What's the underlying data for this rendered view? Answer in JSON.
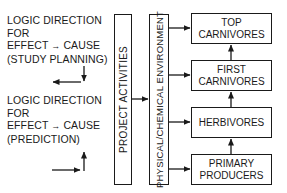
{
  "logic_blocks": [
    {
      "line1": "LOGIC DIRECTION",
      "line2": "FOR",
      "line3a": "EFFECT",
      "line3b": "CAUSE",
      "line4": "(STUDY PLANNING)"
    },
    {
      "line1": "LOGIC DIRECTION",
      "line2": "FOR",
      "line3a": "EFFECT",
      "line3b": "CAUSE",
      "line4": "(PREDICTION)"
    }
  ],
  "boxes": {
    "project": "PROJECT ACTIVITIES",
    "environment": "PHYSICAL/CHEMICAL ENVIRONMENT",
    "trophic": [
      {
        "line1": "TOP",
        "line2": "CARNIVORES"
      },
      {
        "line1": "FIRST",
        "line2": "CARNIVORES"
      },
      {
        "line1": "HERBIVORES",
        "line2": ""
      },
      {
        "line1": "PRIMARY",
        "line2": "PRODUCERS"
      }
    ]
  },
  "colors": {
    "stroke": "#1a1a1a",
    "background": "#ffffff"
  }
}
